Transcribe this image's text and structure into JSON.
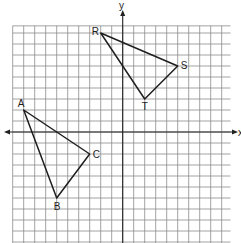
{
  "diagram": {
    "type": "coordinate-plane",
    "axes": {
      "x_label": "x",
      "y_label": "y"
    },
    "grid": {
      "x_min": -10,
      "x_max": 10,
      "y_min": -10,
      "y_max": 10
    },
    "colors": {
      "grid": "#8a8a8a",
      "axis": "#222222",
      "shape": "#1e1e1e"
    },
    "triangles": [
      {
        "name": "ABC",
        "vertices": [
          {
            "label": "A",
            "x": -9,
            "y": 2
          },
          {
            "label": "B",
            "x": -6,
            "y": -6
          },
          {
            "label": "C",
            "x": -3,
            "y": -2
          }
        ]
      },
      {
        "name": "RST",
        "vertices": [
          {
            "label": "R",
            "x": -2,
            "y": 9
          },
          {
            "label": "S",
            "x": 5,
            "y": 6
          },
          {
            "label": "T",
            "x": 2,
            "y": 3
          }
        ]
      }
    ]
  }
}
